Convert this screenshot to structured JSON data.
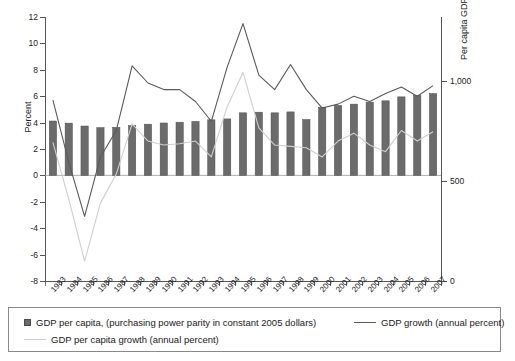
{
  "chart_data": {
    "type": "bar",
    "title": "",
    "xlabel": "",
    "ylabel": "Percent",
    "y2label": "Per capita GDP (dollars)",
    "ylim": [
      -8,
      12
    ],
    "y2lim": [
      0,
      1320
    ],
    "yticks": [
      -8,
      -6,
      -4,
      -2,
      0,
      2,
      4,
      6,
      8,
      10,
      12
    ],
    "ytick_labels": [
      "-8",
      "-6",
      "-4",
      "-2",
      "0",
      "2",
      "4",
      "6",
      "8",
      "10",
      "12"
    ],
    "y2ticks": [
      0,
      500,
      1000
    ],
    "y2tick_labels": [
      "0",
      "500",
      "1,000"
    ],
    "grid": false,
    "legend_position": "bottom",
    "categories": [
      "1983",
      "1984",
      "1985",
      "1986",
      "1987",
      "1988",
      "1989",
      "1990",
      "1991",
      "1992",
      "1993",
      "1994",
      "1995",
      "1996",
      "1997",
      "1998",
      "1999",
      "2000",
      "2001",
      "2002",
      "2003",
      "2004",
      "2005",
      "2006",
      "2007"
    ],
    "series": [
      {
        "name": "GDP per capita, (purchasing power parity in constant 2005 dollars)",
        "type": "bar",
        "axis": "right",
        "unit": "dollars",
        "color": "#6b6b6b",
        "values": [
          543,
          522,
          494,
          478,
          480,
          498,
          511,
          524,
          531,
          540,
          556,
          565,
          625,
          632,
          625,
          634,
          558,
          682,
          700,
          712,
          732,
          745,
          785,
          800,
          818
        ],
        "percent_equivalent": [
          4.12,
          3.96,
          3.74,
          3.62,
          3.64,
          3.78,
          3.88,
          3.97,
          4.03,
          4.09,
          4.21,
          4.28,
          4.74,
          4.79,
          4.74,
          4.81,
          4.23,
          5.17,
          5.3,
          5.4,
          5.55,
          5.65,
          5.95,
          6.06,
          6.2
        ]
      },
      {
        "name": "GDP growth (annual percent)",
        "type": "line",
        "axis": "left",
        "unit": "percent",
        "color": "#5a5a5a",
        "values": [
          5.7,
          1.0,
          -3.1,
          1.4,
          3.4,
          8.3,
          7.0,
          6.5,
          6.5,
          5.6,
          4.1,
          8.2,
          11.5,
          7.6,
          6.5,
          8.4,
          6.5,
          5.1,
          5.4,
          6.0,
          5.6,
          6.2,
          6.7,
          6.0,
          6.8
        ]
      },
      {
        "name": "GDP per capita growth (annual percent)",
        "type": "line",
        "axis": "left",
        "unit": "percent",
        "color": "#cfcfcf",
        "values": [
          2.5,
          -1.8,
          -6.5,
          -2.1,
          0.1,
          3.9,
          2.6,
          2.3,
          2.4,
          2.6,
          1.4,
          5.2,
          7.8,
          3.6,
          2.3,
          2.2,
          2.1,
          1.4,
          2.6,
          3.2,
          2.3,
          1.8,
          3.4,
          2.6,
          3.3
        ]
      }
    ]
  },
  "axes": {
    "left_title": "Percent",
    "right_title": "Per capita GDP (dollars)"
  },
  "legend": {
    "entries": [
      {
        "label": "GDP per capita, (purchasing power parity in constant 2005 dollars)",
        "marker": "square",
        "color": "#6b6b6b"
      },
      {
        "label": "GDP growth (annual percent)",
        "marker": "line",
        "color": "#5a5a5a"
      },
      {
        "label": "GDP per capita growth (annual percent)",
        "marker": "line-light",
        "color": "#cfcfcf"
      }
    ]
  },
  "colors": {
    "bar": "#6b6b6b",
    "gdp_growth_line": "#5a5a5a",
    "per_capita_growth_line": "#cfcfcf",
    "axis": "#555555",
    "background": "#ffffff"
  }
}
